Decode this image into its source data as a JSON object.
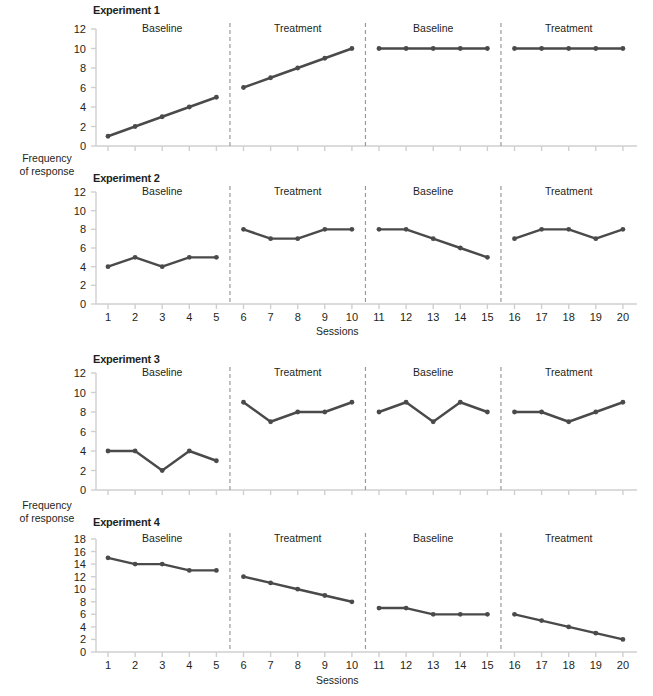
{
  "figure": {
    "y_axis_label_line1": "Frequency",
    "y_axis_label_line2": "of response",
    "x_axis_label": "Sessions",
    "line_color": "#4a4a4a",
    "marker_color": "#4a4a4a",
    "axis_color": "#cfcfcf",
    "divider_color": "#9a9a9a",
    "text_color": "#231f20"
  },
  "chart_data": [
    {
      "type": "line",
      "title": "Experiment 1",
      "xlabel": "",
      "ylabel": "Frequency of response",
      "x": [
        1,
        2,
        3,
        4,
        5,
        6,
        7,
        8,
        9,
        10,
        11,
        12,
        13,
        14,
        15,
        16,
        17,
        18,
        19,
        20
      ],
      "xticklabels": [
        "",
        "",
        "",
        "",
        "",
        "",
        "",
        "",
        "",
        "",
        "",
        "",
        "",
        "",
        "",
        "",
        "",
        "",
        "",
        ""
      ],
      "values": [
        1,
        2,
        3,
        4,
        5,
        6,
        7,
        8,
        9,
        10,
        10,
        10,
        10,
        10,
        10,
        10,
        10,
        10,
        10,
        10
      ],
      "ylim": [
        0,
        12
      ],
      "yticks": [
        0,
        2,
        4,
        6,
        8,
        10,
        12
      ],
      "grid": false,
      "legend": "none",
      "phases": [
        {
          "label": "Baseline",
          "sessions": [
            1,
            2,
            3,
            4,
            5
          ]
        },
        {
          "label": "Treatment",
          "sessions": [
            6,
            7,
            8,
            9,
            10
          ]
        },
        {
          "label": "Baseline",
          "sessions": [
            11,
            12,
            13,
            14,
            15
          ]
        },
        {
          "label": "Treatment",
          "sessions": [
            16,
            17,
            18,
            19,
            20
          ]
        }
      ]
    },
    {
      "type": "line",
      "title": "Experiment 2",
      "xlabel": "Sessions",
      "ylabel": "Frequency of response",
      "x": [
        1,
        2,
        3,
        4,
        5,
        6,
        7,
        8,
        9,
        10,
        11,
        12,
        13,
        14,
        15,
        16,
        17,
        18,
        19,
        20
      ],
      "xticklabels": [
        "1",
        "2",
        "3",
        "4",
        "5",
        "6",
        "7",
        "8",
        "9",
        "10",
        "11",
        "12",
        "13",
        "14",
        "15",
        "16",
        "17",
        "18",
        "19",
        "20"
      ],
      "values": [
        4,
        5,
        4,
        5,
        5,
        8,
        7,
        7,
        8,
        8,
        8,
        8,
        7,
        6,
        5,
        7,
        8,
        8,
        7,
        8
      ],
      "ylim": [
        0,
        12
      ],
      "yticks": [
        0,
        2,
        4,
        6,
        8,
        10,
        12
      ],
      "grid": false,
      "legend": "none",
      "phases": [
        {
          "label": "Baseline",
          "sessions": [
            1,
            2,
            3,
            4,
            5
          ]
        },
        {
          "label": "Treatment",
          "sessions": [
            6,
            7,
            8,
            9,
            10
          ]
        },
        {
          "label": "Baseline",
          "sessions": [
            11,
            12,
            13,
            14,
            15
          ]
        },
        {
          "label": "Treatment",
          "sessions": [
            16,
            17,
            18,
            19,
            20
          ]
        }
      ]
    },
    {
      "type": "line",
      "title": "Experiment 3",
      "xlabel": "",
      "ylabel": "Frequency of response",
      "x": [
        1,
        2,
        3,
        4,
        5,
        6,
        7,
        8,
        9,
        10,
        11,
        12,
        13,
        14,
        15,
        16,
        17,
        18,
        19,
        20
      ],
      "xticklabels": [
        "",
        "",
        "",
        "",
        "",
        "",
        "",
        "",
        "",
        "",
        "",
        "",
        "",
        "",
        "",
        "",
        "",
        "",
        "",
        ""
      ],
      "values": [
        4,
        4,
        2,
        4,
        3,
        9,
        7,
        8,
        8,
        9,
        8,
        9,
        7,
        9,
        8,
        8,
        8,
        7,
        8,
        9
      ],
      "ylim": [
        0,
        12
      ],
      "yticks": [
        0,
        2,
        4,
        6,
        8,
        10,
        12
      ],
      "grid": false,
      "legend": "none",
      "phases": [
        {
          "label": "Baseline",
          "sessions": [
            1,
            2,
            3,
            4,
            5
          ]
        },
        {
          "label": "Treatment",
          "sessions": [
            6,
            7,
            8,
            9,
            10
          ]
        },
        {
          "label": "Baseline",
          "sessions": [
            11,
            12,
            13,
            14,
            15
          ]
        },
        {
          "label": "Treatment",
          "sessions": [
            16,
            17,
            18,
            19,
            20
          ]
        }
      ]
    },
    {
      "type": "line",
      "title": "Experiment 4",
      "xlabel": "Sessions",
      "ylabel": "Frequency of response",
      "x": [
        1,
        2,
        3,
        4,
        5,
        6,
        7,
        8,
        9,
        10,
        11,
        12,
        13,
        14,
        15,
        16,
        17,
        18,
        19,
        20
      ],
      "xticklabels": [
        "1",
        "2",
        "3",
        "4",
        "5",
        "6",
        "7",
        "8",
        "9",
        "10",
        "11",
        "12",
        "13",
        "14",
        "15",
        "16",
        "17",
        "18",
        "19",
        "20"
      ],
      "values": [
        15,
        14,
        14,
        13,
        13,
        12,
        11,
        10,
        9,
        8,
        7,
        7,
        6,
        6,
        6,
        6,
        5,
        4,
        3,
        2
      ],
      "ylim": [
        0,
        18
      ],
      "yticks": [
        0,
        2,
        4,
        6,
        8,
        10,
        12,
        14,
        16,
        18
      ],
      "grid": false,
      "legend": "none",
      "phases": [
        {
          "label": "Baseline",
          "sessions": [
            1,
            2,
            3,
            4,
            5
          ]
        },
        {
          "label": "Treatment",
          "sessions": [
            6,
            7,
            8,
            9,
            10
          ]
        },
        {
          "label": "Baseline",
          "sessions": [
            11,
            12,
            13,
            14,
            15
          ]
        },
        {
          "label": "Treatment",
          "sessions": [
            16,
            17,
            18,
            19,
            20
          ]
        }
      ]
    }
  ]
}
